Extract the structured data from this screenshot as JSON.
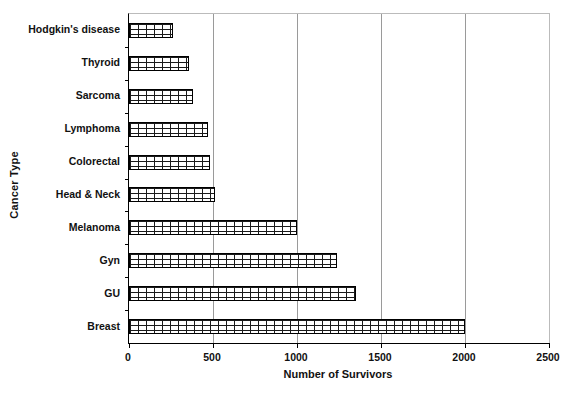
{
  "chart_data": {
    "type": "bar",
    "orientation": "horizontal",
    "title": "",
    "xlabel": "Number of Survivors",
    "ylabel": "Cancer Type",
    "categories": [
      "Hodgkin's disease",
      "Thyroid",
      "Sarcoma",
      "Lymphoma",
      "Colorectal",
      "Head & Neck",
      "Melanoma",
      "Gyn",
      "GU",
      "Breast"
    ],
    "values": [
      260,
      360,
      380,
      470,
      480,
      510,
      1000,
      1240,
      1350,
      2000
    ],
    "xlim": [
      0,
      2500
    ],
    "xticks": [
      0,
      500,
      1000,
      1500,
      2000,
      2500
    ],
    "xtick_labels": [
      "0",
      "500",
      "1000",
      "1500",
      "2000",
      "2500"
    ],
    "gridlines": [
      500,
      1000,
      1500,
      2000
    ],
    "grid": true,
    "legend": "none",
    "bar_fill": "brick-pattern",
    "bar_edge_color": "#000000",
    "grid_color": "#9a9a9a",
    "axis_color": "#000000",
    "frame_color": "#bbbbbb",
    "background": "#ffffff"
  }
}
